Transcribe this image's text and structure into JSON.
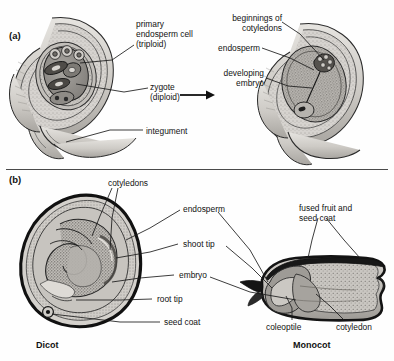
{
  "figure": {
    "panels": [
      {
        "id": "a",
        "letter": "(a)",
        "name": "ovule-development",
        "labels": [
          {
            "name": "primary-endosperm-cell",
            "text": "primary\nendosperm cell\n(triploid)"
          },
          {
            "name": "zygote",
            "text": "zygote\n(diploid)"
          },
          {
            "name": "integument",
            "text": "integument"
          },
          {
            "name": "beginnings-of-cotyledons",
            "text": "beginnings of\ncotyledons"
          },
          {
            "name": "endosperm",
            "text": "endosperm"
          },
          {
            "name": "developing-embryo",
            "text": "developing\nembryo"
          }
        ]
      },
      {
        "id": "b",
        "letter": "(b)",
        "name": "mature-seed-structure",
        "labels": [
          {
            "name": "cotyledons",
            "text": "cotyledons"
          },
          {
            "name": "endosperm",
            "text": "endosperm"
          },
          {
            "name": "shoot-tip",
            "text": "shoot tip"
          },
          {
            "name": "embryo",
            "text": "embryo"
          },
          {
            "name": "root-tip",
            "text": "root tip"
          },
          {
            "name": "seed-coat",
            "text": "seed coat"
          },
          {
            "name": "fused-fruit-and-seed-coat",
            "text": "fused fruit and\nseed coat"
          },
          {
            "name": "coleoptile",
            "text": "coleoptile"
          },
          {
            "name": "cotyledon",
            "text": "cotyledon"
          }
        ],
        "captions": [
          {
            "name": "dicot-caption",
            "text": "Dicot"
          },
          {
            "name": "monocot-caption",
            "text": "Monocot"
          }
        ]
      }
    ],
    "colors": {
      "ink": "#1a1a1a",
      "outline": "#111111",
      "tissue_light": "#d8d6d2",
      "tissue_mid": "#b9b6b1",
      "tissue_dark": "#8e8b86",
      "stipple": "#5f5d59",
      "background": "#ffffff"
    }
  }
}
